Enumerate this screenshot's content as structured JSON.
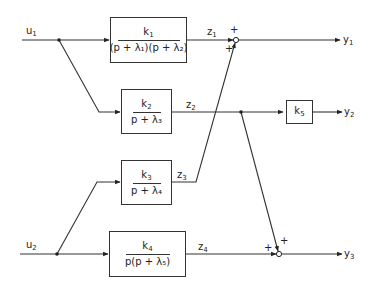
{
  "diagram": {
    "type": "block-diagram",
    "inputs": [
      {
        "id": "u1",
        "base": "u",
        "sub": "1"
      },
      {
        "id": "u2",
        "base": "u",
        "sub": "2"
      }
    ],
    "outputs": [
      {
        "id": "y1",
        "base": "y",
        "sub": "1"
      },
      {
        "id": "y2",
        "base": "y",
        "sub": "2"
      },
      {
        "id": "y3",
        "base": "y",
        "sub": "3"
      }
    ],
    "signals": [
      {
        "id": "z1",
        "base": "z",
        "sub": "1"
      },
      {
        "id": "z2",
        "base": "z",
        "sub": "2"
      },
      {
        "id": "z3",
        "base": "z",
        "sub": "3"
      },
      {
        "id": "z4",
        "base": "z",
        "sub": "4"
      }
    ],
    "blocks": [
      {
        "id": "G1",
        "num_base": "k",
        "num_sub": "1",
        "den_text": "(p + λ₁)(p + λ₂)",
        "input": "u1",
        "output": "z1"
      },
      {
        "id": "G2",
        "num_base": "k",
        "num_sub": "2",
        "den_text": "p + λ₃",
        "input": "u1",
        "output": "z2"
      },
      {
        "id": "G3",
        "num_base": "k",
        "num_sub": "3",
        "den_text": "p + λ₄",
        "input": "u2",
        "output": "z3"
      },
      {
        "id": "G4",
        "num_base": "k",
        "num_sub": "4",
        "den_text": "p(p + λ₅)",
        "input": "u2",
        "output": "z4"
      },
      {
        "id": "G5",
        "num_base": "k",
        "num_sub": "5",
        "den_text": "",
        "input": "z2",
        "output": "y2"
      }
    ],
    "summing_junctions": [
      {
        "id": "S1",
        "inputs": [
          "z1",
          "z3"
        ],
        "signs": [
          "+",
          "+"
        ],
        "output": "y1"
      },
      {
        "id": "S2",
        "inputs": [
          "z4",
          "z2"
        ],
        "signs": [
          "+",
          "+"
        ],
        "output": "y3"
      }
    ],
    "signs": {
      "plus": "+"
    }
  }
}
